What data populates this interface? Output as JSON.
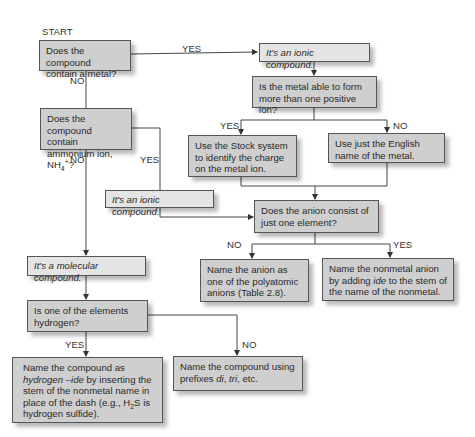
{
  "diagram": {
    "start_label": "START",
    "edge_labels": {
      "metal_yes": "YES",
      "metal_no": "NO",
      "multi_ion_yes": "YES",
      "multi_ion_no": "NO",
      "ammonium_yes": "YES",
      "ammonium_no": "NO",
      "one_element_no": "NO",
      "one_element_yes": "YES",
      "hydrogen_yes": "YES",
      "hydrogen_no": "NO"
    },
    "nodes": {
      "contains_metal": "Does the compound contain a metal?",
      "ionic_top": "It's an ionic compound.",
      "multi_ion": "Is the metal able to form more than one positive ion?",
      "stock_system": "Use the Stock system to identify the charge on the metal ion.",
      "english_name": "Use just the English name of the metal.",
      "ammonium_q_prefix": "Does the compound contain ammonium ion, NH",
      "ammonium_q_sub": "4",
      "ammonium_q_sup": "+",
      "ammonium_q_suffix": "?",
      "ionic_mid": "It's an ionic compound.",
      "one_element": "Does the anion consist of just one element?",
      "molecular": "It's a molecular compound.",
      "polyatomic": "Name the anion as one of the polyatomic anions (Table 2.8).",
      "nonmetal_anion_a": "Name the nonmetal anion by adding ",
      "nonmetal_anion_em": "ide",
      "nonmetal_anion_b": " to the stem of the name of the nonmetal.",
      "hydrogen_q": "Is one of the elements hydrogen?",
      "hydrogen_ide_a": "Name the compound as ",
      "hydrogen_ide_em": "hydrogen –ide",
      "hydrogen_ide_b": " by inserting the stem of the nonmetal name in place of the dash (e.g., H",
      "hydrogen_ide_sub": "2",
      "hydrogen_ide_c": "S is hydrogen sulfide).",
      "prefixes_a": "Name the compound using prefixes ",
      "prefixes_em1": "di",
      "prefixes_sep": ", ",
      "prefixes_em2": "tri",
      "prefixes_b": ", etc."
    },
    "colors": {
      "box_fill": "#cfcfcf",
      "italic_box_fill": "#e4e4e4",
      "border": "#555555",
      "line": "#444444"
    }
  }
}
